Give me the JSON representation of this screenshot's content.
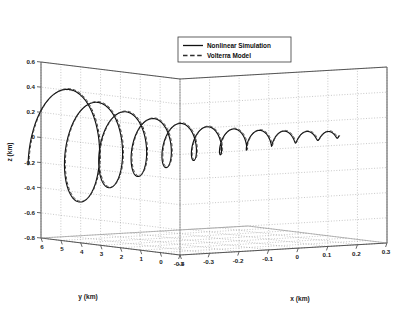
{
  "chart_data": {
    "type": "line",
    "title": "",
    "xlabel": "x (km)",
    "ylabel": "y (km)",
    "zlabel": "z (km)",
    "projection": "3d",
    "grid": true,
    "xlim": [
      -0.4,
      0.3
    ],
    "ylim": [
      -1,
      6
    ],
    "zlim": [
      -0.8,
      0.6
    ],
    "xticks": [
      "-0.4",
      "-0.3",
      "-0.2",
      "-0.1",
      "0",
      "0.1",
      "0.2",
      "0.3"
    ],
    "xtick_values": [
      -0.4,
      -0.3,
      -0.2,
      -0.1,
      0,
      0.1,
      0.2,
      0.3
    ],
    "yticks": [
      "6",
      "5",
      "4",
      "3",
      "2",
      "1",
      "0",
      "-1"
    ],
    "ytick_values": [
      6,
      5,
      4,
      3,
      2,
      1,
      0,
      -1
    ],
    "zticks": [
      "0.6",
      "0.4",
      "0.2",
      "0",
      "-0.2",
      "-0.4",
      "-0.6",
      "-0.8"
    ],
    "ztick_values": [
      0.6,
      0.4,
      0.2,
      0,
      -0.2,
      -0.4,
      -0.6,
      -0.8
    ],
    "legend_position": "top-center",
    "series": [
      {
        "name": "Nonlinear Simulation",
        "style": "solid",
        "color": "#111111",
        "description": "Decaying 3D helical spiral trajectory converging from large loops at low x / high y toward a dense focus at high x / low y"
      },
      {
        "name": "Volterra Model",
        "style": "dashed",
        "color": "#3a3a3a",
        "description": "Dashed curve overlaying the nonlinear simulation spiral, nearly coincident"
      }
    ],
    "spiral": {
      "turns": 11,
      "x_start": -0.37,
      "x_end": 0.22,
      "y_start": 5.6,
      "y_end": 0.15,
      "z_center_start": -0.1,
      "z_center_end": 0.05,
      "radius_start": 0.52,
      "radius_end": 0.035,
      "radius_decay": 0.76
    }
  },
  "legend": {
    "entries": [
      {
        "label": "Nonlinear Simulation",
        "style": "solid"
      },
      {
        "label": "Volterra Model",
        "style": "dashed"
      }
    ]
  },
  "axes": {
    "x_title": "x (km)",
    "y_title": "y (km)",
    "z_title": "z (km)"
  },
  "caption": {
    "text": ""
  },
  "colors": {
    "background": "#ffffff",
    "axis": "#555555",
    "grid": "#9a9a9a",
    "curve": "#111111",
    "text": "#1a1a1a"
  }
}
